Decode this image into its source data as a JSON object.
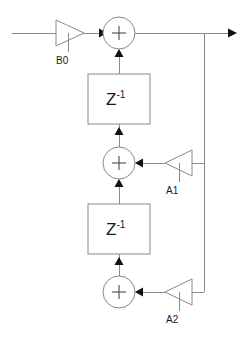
{
  "diagram": {
    "type": "signal-flow-block-diagram",
    "colors": {
      "wire": "#8a8a8a",
      "outline": "#8a8a8a",
      "arrowhead": "#111111",
      "text": "#1a1a1a",
      "background": "#ffffff"
    },
    "gains": [
      {
        "id": "b0",
        "label": "B0",
        "orientation": "right",
        "cx": 70,
        "cy": 33
      },
      {
        "id": "a1",
        "label": "A1",
        "orientation": "left",
        "cx": 176,
        "cy": 163
      },
      {
        "id": "a2",
        "label": "A2",
        "orientation": "left",
        "cx": 176,
        "cy": 292
      }
    ],
    "summers": [
      {
        "id": "sum-top",
        "symbol": "+",
        "cx": 119,
        "cy": 33
      },
      {
        "id": "sum-middle",
        "symbol": "+",
        "cx": 119,
        "cy": 163
      },
      {
        "id": "sum-bottom",
        "symbol": "+",
        "cx": 119,
        "cy": 292
      }
    ],
    "delays": [
      {
        "id": "delay-1",
        "base": "Z",
        "exponent": "-1",
        "cx": 119,
        "cy": 98
      },
      {
        "id": "delay-2",
        "base": "Z",
        "exponent": "-1",
        "cx": 119,
        "cy": 233
      }
    ],
    "ports": {
      "input_label": "",
      "output_label": ""
    }
  }
}
